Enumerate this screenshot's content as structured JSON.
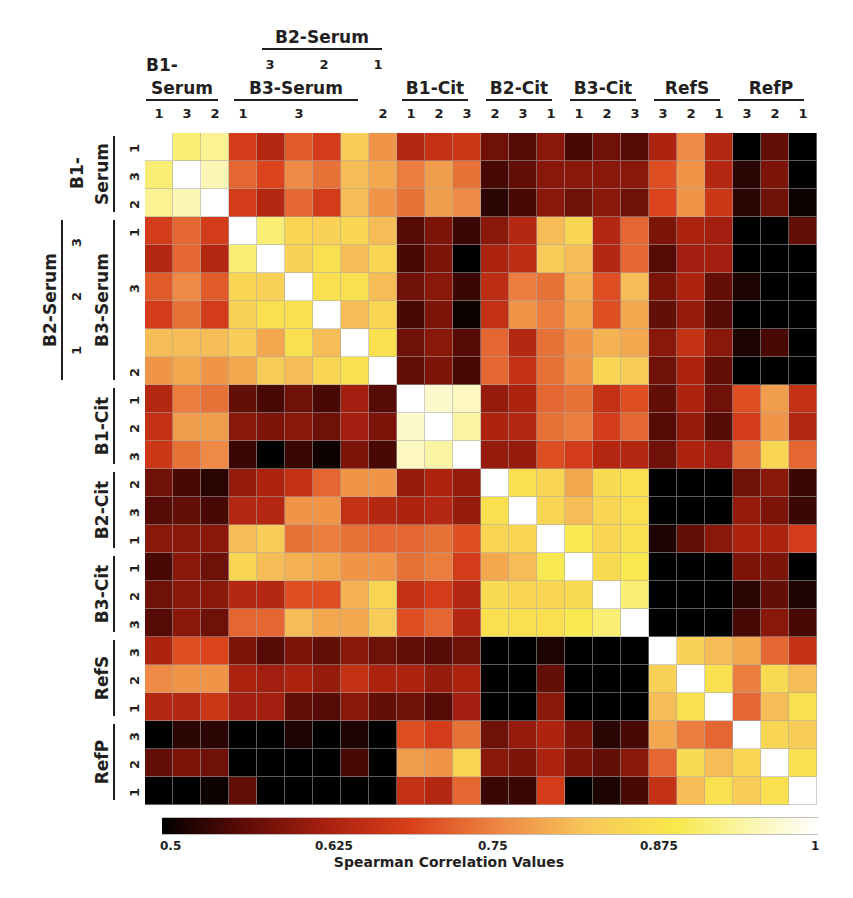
{
  "chart_data": {
    "type": "heatmap",
    "title": "",
    "colorbar_label": "Spearman Correlation Values",
    "colorbar_ticks": [
      "0.5",
      "0.625",
      "0.75",
      "0.875",
      "1"
    ],
    "value_range": [
      0.5,
      1
    ],
    "colormap": [
      "#000000",
      "#5a0b06",
      "#a8200f",
      "#d9401a",
      "#ee8a45",
      "#f8c85a",
      "#f8e84a",
      "#fbf6b0",
      "#ffffff"
    ],
    "groups": [
      {
        "name": "B1-Serum",
        "members": [
          "1",
          "3",
          "2"
        ]
      },
      {
        "name": "B3-Serum",
        "members": [
          "1",
          "",
          "3",
          "",
          "",
          "2"
        ],
        "alt_name": "B2-Serum",
        "alt_members": [
          "3",
          "2",
          "1"
        ]
      },
      {
        "name": "B1-Cit",
        "members": [
          "1",
          "2",
          "3"
        ]
      },
      {
        "name": "B2-Cit",
        "members": [
          "2",
          "3",
          "1"
        ]
      },
      {
        "name": "B3-Cit",
        "members": [
          "1",
          "2",
          "3"
        ]
      },
      {
        "name": "RefS",
        "members": [
          "3",
          "2",
          "1"
        ]
      },
      {
        "name": "RefP",
        "members": [
          "3",
          "2",
          "1"
        ]
      }
    ],
    "labels": [
      "B1S-1",
      "B1S-3",
      "B1S-2",
      "B3S-1",
      "B2S-3",
      "B3S-3",
      "B2S-2",
      "B3S-2",
      "B2S-1",
      "B1C-1",
      "B1C-2",
      "B1C-3",
      "B2C-2",
      "B2C-3",
      "B2C-1",
      "B3C-1",
      "B3C-2",
      "B3C-3",
      "RefS-3",
      "RefS-2",
      "RefS-1",
      "RefP-3",
      "RefP-2",
      "RefP-1"
    ],
    "matrix": [
      [
        1.0,
        0.9,
        0.92,
        0.68,
        0.64,
        0.71,
        0.68,
        0.82,
        0.76,
        0.64,
        0.66,
        0.67,
        0.58,
        0.56,
        0.6,
        0.55,
        0.58,
        0.56,
        0.63,
        0.75,
        0.64,
        0.5,
        0.57,
        0.5
      ],
      [
        0.9,
        1.0,
        0.94,
        0.72,
        0.69,
        0.75,
        0.73,
        0.8,
        0.78,
        0.74,
        0.77,
        0.73,
        0.55,
        0.57,
        0.6,
        0.6,
        0.6,
        0.6,
        0.7,
        0.76,
        0.64,
        0.53,
        0.59,
        0.5
      ],
      [
        0.92,
        0.94,
        1.0,
        0.68,
        0.64,
        0.72,
        0.68,
        0.8,
        0.76,
        0.73,
        0.77,
        0.75,
        0.53,
        0.55,
        0.6,
        0.58,
        0.6,
        0.58,
        0.69,
        0.76,
        0.67,
        0.53,
        0.58,
        0.51
      ],
      [
        0.68,
        0.72,
        0.68,
        1.0,
        0.9,
        0.84,
        0.83,
        0.84,
        0.8,
        0.56,
        0.59,
        0.54,
        0.6,
        0.64,
        0.8,
        0.84,
        0.64,
        0.72,
        0.59,
        0.63,
        0.62,
        0.5,
        0.5,
        0.57
      ],
      [
        0.64,
        0.72,
        0.64,
        0.9,
        1.0,
        0.83,
        0.86,
        0.8,
        0.84,
        0.55,
        0.59,
        0.5,
        0.63,
        0.65,
        0.82,
        0.8,
        0.64,
        0.72,
        0.56,
        0.62,
        0.62,
        0.5,
        0.5,
        0.5
      ],
      [
        0.71,
        0.75,
        0.71,
        0.84,
        0.83,
        1.0,
        0.86,
        0.86,
        0.8,
        0.58,
        0.6,
        0.54,
        0.65,
        0.74,
        0.73,
        0.79,
        0.7,
        0.8,
        0.59,
        0.63,
        0.57,
        0.52,
        0.5,
        0.5
      ],
      [
        0.68,
        0.73,
        0.68,
        0.83,
        0.86,
        0.86,
        1.0,
        0.8,
        0.84,
        0.55,
        0.59,
        0.51,
        0.66,
        0.76,
        0.74,
        0.78,
        0.7,
        0.78,
        0.57,
        0.61,
        0.56,
        0.5,
        0.5,
        0.5
      ],
      [
        0.8,
        0.8,
        0.8,
        0.82,
        0.78,
        0.86,
        0.8,
        1.0,
        0.86,
        0.58,
        0.6,
        0.56,
        0.72,
        0.64,
        0.73,
        0.76,
        0.79,
        0.78,
        0.6,
        0.66,
        0.6,
        0.52,
        0.55,
        0.5
      ],
      [
        0.76,
        0.78,
        0.76,
        0.78,
        0.82,
        0.8,
        0.84,
        0.86,
        1.0,
        0.57,
        0.59,
        0.55,
        0.72,
        0.66,
        0.73,
        0.76,
        0.84,
        0.82,
        0.58,
        0.63,
        0.57,
        0.5,
        0.5,
        0.5
      ],
      [
        0.64,
        0.74,
        0.73,
        0.57,
        0.55,
        0.58,
        0.55,
        0.62,
        0.56,
        1.0,
        0.96,
        0.95,
        0.61,
        0.63,
        0.72,
        0.73,
        0.66,
        0.7,
        0.57,
        0.63,
        0.58,
        0.7,
        0.77,
        0.66
      ],
      [
        0.66,
        0.77,
        0.77,
        0.6,
        0.59,
        0.6,
        0.58,
        0.62,
        0.59,
        0.96,
        1.0,
        0.93,
        0.63,
        0.64,
        0.73,
        0.74,
        0.68,
        0.72,
        0.56,
        0.61,
        0.56,
        0.68,
        0.76,
        0.64
      ],
      [
        0.67,
        0.73,
        0.75,
        0.54,
        0.5,
        0.54,
        0.51,
        0.59,
        0.55,
        0.95,
        0.93,
        1.0,
        0.61,
        0.61,
        0.7,
        0.68,
        0.64,
        0.64,
        0.58,
        0.63,
        0.62,
        0.73,
        0.84,
        0.72
      ],
      [
        0.58,
        0.55,
        0.53,
        0.61,
        0.63,
        0.66,
        0.72,
        0.76,
        0.76,
        0.61,
        0.63,
        0.61,
        1.0,
        0.86,
        0.84,
        0.78,
        0.85,
        0.86,
        0.5,
        0.5,
        0.5,
        0.58,
        0.6,
        0.54
      ],
      [
        0.56,
        0.57,
        0.55,
        0.64,
        0.64,
        0.76,
        0.76,
        0.66,
        0.64,
        0.63,
        0.64,
        0.61,
        0.86,
        1.0,
        0.84,
        0.8,
        0.84,
        0.86,
        0.5,
        0.5,
        0.5,
        0.61,
        0.59,
        0.54
      ],
      [
        0.6,
        0.6,
        0.6,
        0.8,
        0.82,
        0.73,
        0.74,
        0.73,
        0.72,
        0.72,
        0.73,
        0.7,
        0.84,
        0.84,
        1.0,
        0.88,
        0.84,
        0.86,
        0.52,
        0.57,
        0.6,
        0.63,
        0.63,
        0.68
      ],
      [
        0.55,
        0.6,
        0.58,
        0.84,
        0.8,
        0.79,
        0.78,
        0.76,
        0.76,
        0.73,
        0.74,
        0.68,
        0.78,
        0.8,
        0.88,
        1.0,
        0.85,
        0.88,
        0.5,
        0.5,
        0.5,
        0.59,
        0.59,
        0.5
      ],
      [
        0.58,
        0.6,
        0.6,
        0.64,
        0.64,
        0.7,
        0.7,
        0.79,
        0.84,
        0.66,
        0.68,
        0.64,
        0.85,
        0.84,
        0.84,
        0.85,
        1.0,
        0.9,
        0.5,
        0.5,
        0.5,
        0.53,
        0.57,
        0.52
      ],
      [
        0.56,
        0.6,
        0.58,
        0.72,
        0.72,
        0.8,
        0.78,
        0.78,
        0.82,
        0.7,
        0.72,
        0.64,
        0.86,
        0.86,
        0.86,
        0.88,
        0.9,
        1.0,
        0.5,
        0.5,
        0.5,
        0.55,
        0.6,
        0.55
      ],
      [
        0.63,
        0.7,
        0.69,
        0.59,
        0.56,
        0.59,
        0.57,
        0.6,
        0.58,
        0.57,
        0.56,
        0.58,
        0.5,
        0.5,
        0.52,
        0.5,
        0.5,
        0.5,
        1.0,
        0.83,
        0.8,
        0.78,
        0.72,
        0.66
      ],
      [
        0.75,
        0.76,
        0.76,
        0.63,
        0.62,
        0.63,
        0.61,
        0.66,
        0.63,
        0.63,
        0.61,
        0.63,
        0.5,
        0.5,
        0.57,
        0.5,
        0.5,
        0.5,
        0.83,
        1.0,
        0.86,
        0.74,
        0.85,
        0.8
      ],
      [
        0.64,
        0.64,
        0.67,
        0.62,
        0.62,
        0.57,
        0.56,
        0.6,
        0.57,
        0.58,
        0.56,
        0.62,
        0.5,
        0.5,
        0.6,
        0.5,
        0.5,
        0.5,
        0.8,
        0.86,
        1.0,
        0.72,
        0.8,
        0.86
      ],
      [
        0.5,
        0.53,
        0.53,
        0.5,
        0.5,
        0.52,
        0.5,
        0.52,
        0.5,
        0.7,
        0.68,
        0.73,
        0.58,
        0.61,
        0.63,
        0.59,
        0.53,
        0.55,
        0.78,
        0.74,
        0.72,
        1.0,
        0.84,
        0.82
      ],
      [
        0.57,
        0.59,
        0.58,
        0.5,
        0.5,
        0.5,
        0.5,
        0.55,
        0.5,
        0.77,
        0.76,
        0.84,
        0.6,
        0.59,
        0.63,
        0.59,
        0.57,
        0.6,
        0.72,
        0.85,
        0.8,
        0.84,
        1.0,
        0.86
      ],
      [
        0.5,
        0.5,
        0.51,
        0.57,
        0.5,
        0.5,
        0.5,
        0.5,
        0.5,
        0.66,
        0.64,
        0.72,
        0.54,
        0.54,
        0.68,
        0.5,
        0.52,
        0.55,
        0.66,
        0.8,
        0.86,
        0.82,
        0.86,
        1.0
      ]
    ],
    "xlabel": "",
    "ylabel": "",
    "grid": true,
    "legend_position": "bottom"
  },
  "labels": {
    "top_groups": {
      "b2serum": "B2-Serum",
      "b1serum_a": "B1-",
      "b1serum_b": "Serum",
      "b3serum": "B3-Serum",
      "b1cit": "B1-Cit",
      "b2cit": "B2-Cit",
      "b3cit": "B3-Cit",
      "refs": "RefS",
      "refp": "RefP"
    },
    "b2serum_ticks": [
      "3",
      "2",
      "1"
    ],
    "col_ticks": [
      "1",
      "3",
      "2",
      "1",
      "",
      "3",
      "",
      "",
      "2",
      "1",
      "2",
      "3",
      "2",
      "3",
      "1",
      "1",
      "2",
      "3",
      "3",
      "2",
      "1",
      "3",
      "2",
      "1"
    ]
  },
  "colorbar": {
    "ticks": [
      "0.5",
      "0.625",
      "0.75",
      "0.875",
      "1"
    ],
    "title": "Spearman Correlation Values"
  }
}
